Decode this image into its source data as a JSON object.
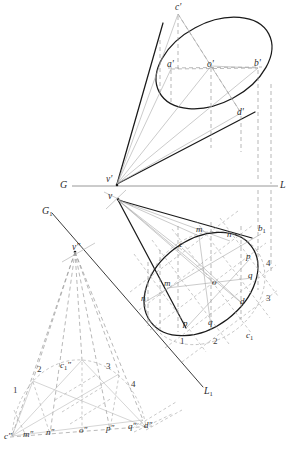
{
  "figure": {
    "type": "descriptive-geometry-construction",
    "ink_color": "#1a1a1a",
    "construction_color": "#8a8a8a",
    "thin_color": "#9a9a9a"
  },
  "ground_line": {
    "left_label": "G",
    "right_label": "L",
    "y": 186,
    "x_start": 72,
    "x_end": 278
  },
  "auxiliary_ground_line": {
    "left_label": "G",
    "left_sub": "1",
    "right_label": "L",
    "right_sub": "1"
  },
  "front_view": {
    "name": "front-elevation-cone",
    "apex_label": "v",
    "apex_prime": "'",
    "points": [
      {
        "id": "c-prime",
        "label": "c",
        "prime": "'",
        "x": 178,
        "y": 10
      },
      {
        "id": "a-prime",
        "label": "a",
        "prime": "'",
        "x": 171,
        "y": 66
      },
      {
        "id": "o-prime",
        "label": "o",
        "prime": "'",
        "x": 211,
        "y": 66
      },
      {
        "id": "b-prime",
        "label": "b",
        "prime": "'",
        "x": 258,
        "y": 65
      },
      {
        "id": "d-prime",
        "label": "d",
        "prime": "'",
        "x": 241,
        "y": 114
      },
      {
        "id": "v-prime",
        "label": "v",
        "prime": "'",
        "x": 117,
        "y": 180
      }
    ]
  },
  "top_view": {
    "name": "plan-view-cone",
    "apex_label": "v",
    "points": [
      {
        "id": "m-upper",
        "label": "m",
        "x": 199,
        "y": 231
      },
      {
        "id": "n-upper",
        "label": "n",
        "x": 230,
        "y": 236
      },
      {
        "id": "b",
        "label": "b",
        "sub": "1",
        "x": 261,
        "y": 230
      },
      {
        "id": "c",
        "label": "c",
        "x": 182,
        "y": 246
      },
      {
        "id": "p",
        "label": "p",
        "x": 249,
        "y": 258
      },
      {
        "id": "m-lower",
        "label": "m",
        "x": 167,
        "y": 285
      },
      {
        "id": "o",
        "label": "o",
        "x": 215,
        "y": 284
      },
      {
        "id": "q-right",
        "label": "q",
        "x": 251,
        "y": 277
      },
      {
        "id": "n-lower",
        "label": "n",
        "x": 144,
        "y": 300
      },
      {
        "id": "d",
        "label": "d",
        "x": 243,
        "y": 303
      },
      {
        "id": "p-lower",
        "label": "p",
        "x": 186,
        "y": 325
      },
      {
        "id": "q-lower",
        "label": "q",
        "x": 211,
        "y": 324
      },
      {
        "id": "c1",
        "label": "c",
        "sub": "1",
        "x": 249,
        "y": 337
      }
    ],
    "numbers": [
      {
        "label": "4",
        "x": 268,
        "y": 265
      },
      {
        "label": "3",
        "x": 268,
        "y": 300
      },
      {
        "label": "1",
        "x": 182,
        "y": 343
      },
      {
        "label": "2",
        "x": 215,
        "y": 343
      }
    ]
  },
  "auxiliary_view": {
    "name": "auxiliary-semicircle-view",
    "apex_label": "v",
    "apex_double_prime": "\"",
    "apex_x": 75,
    "apex_y": 250,
    "baseline_points": [
      {
        "id": "c-dprime",
        "label": "c",
        "mark": "\"",
        "x": 7,
        "y": 438
      },
      {
        "id": "m-dprime",
        "label": "m",
        "mark": "\"",
        "x": 26,
        "y": 436
      },
      {
        "id": "n-dprime",
        "label": "n",
        "mark": "\"",
        "x": 49,
        "y": 434
      },
      {
        "id": "o-dprime",
        "label": "o",
        "mark": "\"",
        "x": 82,
        "y": 432
      },
      {
        "id": "p-dprime",
        "label": "p",
        "mark": "\"",
        "x": 109,
        "y": 430
      },
      {
        "id": "q-dprime",
        "label": "q",
        "mark": "\"",
        "x": 131,
        "y": 428
      },
      {
        "id": "d-dprime",
        "label": "d",
        "mark": "\"",
        "x": 147,
        "y": 427
      }
    ],
    "apex_arc_label": {
      "label": "c",
      "sub": "1",
      "mark": "\"",
      "x": 63,
      "y": 368
    },
    "numbers": [
      {
        "label": "1",
        "x": 15,
        "y": 392
      },
      {
        "label": "2",
        "x": 39,
        "y": 371
      },
      {
        "label": "3",
        "x": 108,
        "y": 368
      },
      {
        "label": "4",
        "x": 133,
        "y": 386
      }
    ]
  }
}
